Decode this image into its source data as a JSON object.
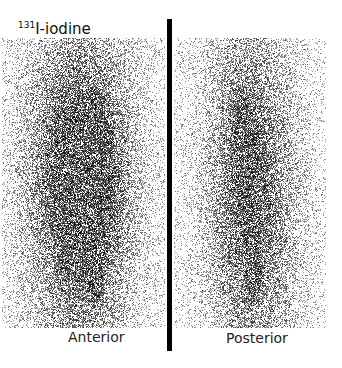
{
  "title": {
    "isotope": "131",
    "agent": "I-iodine"
  },
  "panels": [
    {
      "label": "Anterior",
      "hotspots": [
        {
          "x": 0.5,
          "y": 0.28,
          "r": 0.34,
          "w": 0.55
        },
        {
          "x": 0.55,
          "y": 0.32,
          "r": 0.06,
          "w": 0.9
        },
        {
          "x": 0.35,
          "y": 0.48,
          "r": 0.25,
          "w": 0.55
        },
        {
          "x": 0.62,
          "y": 0.48,
          "r": 0.2,
          "w": 0.45
        },
        {
          "x": 0.5,
          "y": 0.82,
          "r": 0.3,
          "w": 0.55
        },
        {
          "x": 0.57,
          "y": 0.83,
          "r": 0.035,
          "w": 1.0
        }
      ]
    },
    {
      "label": "Posterior",
      "hotspots": [
        {
          "x": 0.45,
          "y": 0.3,
          "r": 0.3,
          "w": 0.45
        },
        {
          "x": 0.45,
          "y": 0.31,
          "r": 0.06,
          "w": 0.7
        },
        {
          "x": 0.55,
          "y": 0.5,
          "r": 0.28,
          "w": 0.5
        },
        {
          "x": 0.5,
          "y": 0.82,
          "r": 0.28,
          "w": 0.5
        },
        {
          "x": 0.52,
          "y": 0.83,
          "r": 0.03,
          "w": 1.0
        }
      ]
    }
  ]
}
